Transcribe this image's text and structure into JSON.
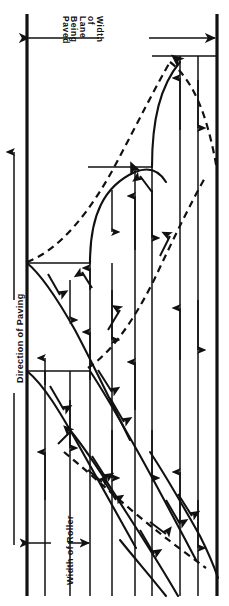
{
  "figure": {
    "type": "engineering-line-diagram",
    "width": 229,
    "height": 606,
    "background_color": "#ffffff",
    "line_color": "#111111"
  },
  "labels": {
    "lane_width": {
      "text": "Width of Lane Being Paved",
      "lines": [
        "Width",
        "of",
        "Lane",
        "Being",
        "Paved"
      ],
      "orientation": "rotated-90-clockwise"
    },
    "direction": {
      "text": "Direction of Paving",
      "orientation": "rotated-90-counterclockwise"
    },
    "roller_width": {
      "text": "Width of Roller",
      "orientation": "rotated-90-counterclockwise"
    }
  },
  "dimension_arrows": [
    {
      "name": "lane-width-dimension",
      "y": 38,
      "x_start": 27,
      "x_end": 217,
      "heads": "both",
      "gap_for_label": [
        100,
        148
      ]
    },
    {
      "name": "direction-of-paving-arrow",
      "x": 14,
      "y_start": 545,
      "y_end": 150,
      "heads": "up"
    },
    {
      "name": "roller-width-dimension",
      "y": 543,
      "x_start": 27,
      "x_end": 90,
      "heads": "both",
      "gap_for_label": [
        52,
        66
      ]
    }
  ],
  "lane_edges": {
    "left_x": 27,
    "right_x": 217,
    "top_y": 14,
    "bottom_y": 596,
    "stroke_width": 3
  },
  "pass_lines": [
    {
      "name": "pass-line-1",
      "x": 45,
      "y_top": 371,
      "y_bottom": 596,
      "arrow": "up",
      "arrow_y": 430
    },
    {
      "name": "pass-line-2",
      "x": 70,
      "y_top": 371,
      "y_bottom": 596,
      "arrow": "down",
      "arrow_y": 430
    },
    {
      "name": "pass-line-3",
      "x": 90,
      "y_top": 263,
      "y_bottom": 596,
      "arrow": "up",
      "arrow_y": 430
    },
    {
      "name": "pass-line-4",
      "x": 112,
      "y_top": 263,
      "y_bottom": 596,
      "arrow": "down",
      "arrow_y": 430
    },
    {
      "name": "pass-line-5",
      "x": 135,
      "y_top": 167,
      "y_bottom": 596,
      "arrow": "up",
      "arrow_y": 430
    },
    {
      "name": "pass-line-6",
      "x": 152,
      "y_top": 167,
      "y_bottom": 596,
      "arrow": "down",
      "arrow_y": 430
    },
    {
      "name": "pass-line-7",
      "x": 180,
      "y_top": 56,
      "y_bottom": 596,
      "arrow": "up",
      "arrow_y": 430
    },
    {
      "name": "pass-line-8",
      "x": 198,
      "y_top": 56,
      "y_bottom": 596,
      "arrow": "down",
      "arrow_y": 430
    }
  ],
  "step_lines": [
    {
      "name": "step-line-top",
      "y": 56,
      "x_start": 152,
      "x_end": 217
    },
    {
      "name": "step-line-second",
      "y": 167,
      "x_start": 88,
      "x_end": 152
    },
    {
      "name": "step-line-third",
      "y": 263,
      "x_start": 27,
      "x_end": 90
    },
    {
      "name": "step-line-fourth",
      "y": 371,
      "x_start": 27,
      "x_end": 90
    }
  ],
  "solid_curves": [
    {
      "name": "solid-turn-upper",
      "description": "S-curve turnaround from second step up to top step"
    },
    {
      "name": "solid-turn-mid",
      "description": "S-curve turnaround from third step up to second step"
    },
    {
      "name": "solid-turn-lower",
      "description": "curve descending from fourth step"
    },
    {
      "name": "solid-diagonal-1",
      "description": "long diagonal pass across lower section"
    },
    {
      "name": "solid-diagonal-2",
      "description": "long diagonal pass across lower section"
    },
    {
      "name": "solid-diagonal-3",
      "description": "long diagonal pass across lower section"
    },
    {
      "name": "solid-diagonal-4",
      "description": "long diagonal pass across lower section"
    }
  ],
  "dashed_curves": [
    {
      "name": "dashed-curve-upper",
      "description": "dashed return path sweeping from left edge to right edge in upper section"
    },
    {
      "name": "dashed-curve-mid",
      "description": "dashed return path through middle steps"
    },
    {
      "name": "dashed-curve-lower",
      "description": "dashed diagonal return path in lower section"
    }
  ]
}
